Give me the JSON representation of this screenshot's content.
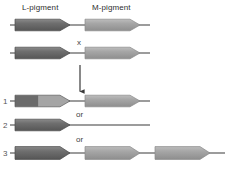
{
  "figure": {
    "type": "genetics-diagram",
    "title": ""
  },
  "headers": [
    {
      "id": "l-pigment",
      "label": "L-pigment",
      "x": 22,
      "y": 3
    },
    {
      "id": "m-pigment",
      "label": "M-pigment",
      "x": 92,
      "y": 3
    }
  ],
  "symbols": {
    "cross": "x",
    "or_1": "or",
    "or_2": "or"
  },
  "row_labels": [
    "1",
    "2",
    "3"
  ],
  "colors": {
    "dark_gene": "#6f6f6f",
    "dark_gene_edge": "#4b4b4b",
    "light_gene": "#a3a3a3",
    "light_gene_edge": "#8a8a8a",
    "line": "#3a3a3a",
    "text": "#3a3a3a",
    "background": "#ffffff"
  },
  "chromosomes": [
    {
      "id": "parent-1",
      "name": "parental-chromosome-top",
      "y": 25,
      "line": {
        "x1": 10,
        "x2": 150
      },
      "genes": [
        {
          "id": "p1-l",
          "pigment": "L-pigment",
          "shade": "dark",
          "x": 15,
          "w": 55
        },
        {
          "id": "p1-m",
          "pigment": "M-pigment",
          "shade": "light",
          "x": 85,
          "w": 55
        }
      ]
    },
    {
      "id": "parent-2",
      "name": "parental-chromosome-bottom",
      "y": 53,
      "line": {
        "x1": 10,
        "x2": 150
      },
      "genes": [
        {
          "id": "p2-l",
          "pigment": "L-pigment",
          "shade": "dark",
          "x": 15,
          "w": 55
        },
        {
          "id": "p2-m",
          "pigment": "M-pigment",
          "shade": "light",
          "x": 85,
          "w": 55
        }
      ]
    },
    {
      "id": "outcome-1",
      "name": "outcome-hybrid-gene-chromosome",
      "y": 101,
      "line": {
        "x1": 10,
        "x2": 150
      },
      "genes": [
        {
          "id": "o1-hybrid",
          "pigment": "L/M hybrid",
          "shade": "hybrid",
          "x": 15,
          "w": 55,
          "split": 0.42
        },
        {
          "id": "o1-m",
          "pigment": "M-pigment",
          "shade": "light",
          "x": 85,
          "w": 55
        }
      ]
    },
    {
      "id": "outcome-2",
      "name": "outcome-single-gene-chromosome",
      "y": 125,
      "line": {
        "x1": 10,
        "x2": 150
      },
      "genes": [
        {
          "id": "o2-l",
          "pigment": "L-pigment",
          "shade": "dark",
          "x": 15,
          "w": 55
        }
      ]
    },
    {
      "id": "outcome-3",
      "name": "outcome-three-gene-chromosome",
      "y": 153,
      "line": {
        "x1": 10,
        "x2": 225
      },
      "genes": [
        {
          "id": "o3-l",
          "pigment": "L-pigment",
          "shade": "dark",
          "x": 15,
          "w": 55
        },
        {
          "id": "o3-m1",
          "pigment": "M-pigment",
          "shade": "light",
          "x": 85,
          "w": 55
        },
        {
          "id": "o3-m2",
          "pigment": "M-pigment",
          "shade": "light",
          "x": 155,
          "w": 55
        }
      ]
    }
  ],
  "arrow": {
    "name": "crossing-over-arrow",
    "x": 80,
    "y_start": 65,
    "y_end": 93
  },
  "annotations": [
    {
      "id": "cross-symbol",
      "text": "x",
      "x": 77,
      "y": 39
    },
    {
      "id": "or-1",
      "text": "or",
      "x": 76,
      "y": 111
    },
    {
      "id": "or-2",
      "text": "or",
      "x": 76,
      "y": 136
    }
  ]
}
